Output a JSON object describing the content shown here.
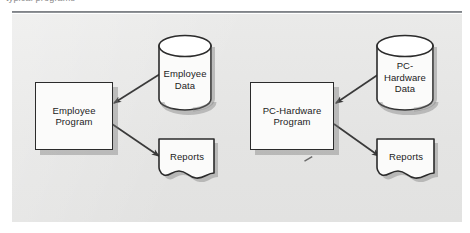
{
  "caption": {
    "text": "typical programs"
  },
  "figure": {
    "background_color": "#e7e7e6",
    "rule_color": "#6f7377",
    "shape_fill": "#fbfbfa",
    "shape_stroke": "#2b2b2b",
    "shadow_color": "#7a7a7a",
    "arrow_color": "#3a3a3a"
  },
  "systems": [
    {
      "id": "employee-system",
      "program": {
        "name": "employee-program-box",
        "label": "Employee\nProgram"
      },
      "data_store": {
        "name": "employee-data-cylinder",
        "label": "Employee\nData"
      },
      "output": {
        "name": "employee-reports-document",
        "label": "Reports"
      },
      "arrows": [
        {
          "name": "arrow-employee-data-to-program",
          "from": "employee-data-cylinder",
          "to": "employee-program-box"
        },
        {
          "name": "arrow-employee-program-to-reports",
          "from": "employee-program-box",
          "to": "employee-reports-document"
        }
      ]
    },
    {
      "id": "pc-hardware-system",
      "program": {
        "name": "pc-hardware-program-box",
        "label": "PC-Hardware\nProgram"
      },
      "data_store": {
        "name": "pc-hardware-data-cylinder",
        "label": "PC-\nHardware\nData"
      },
      "output": {
        "name": "pc-hardware-reports-document",
        "label": "Reports"
      },
      "arrows": [
        {
          "name": "arrow-pc-hardware-data-to-program",
          "from": "pc-hardware-data-cylinder",
          "to": "pc-hardware-program-box"
        },
        {
          "name": "arrow-pc-hardware-program-to-reports",
          "from": "pc-hardware-program-box",
          "to": "pc-hardware-reports-document"
        }
      ]
    }
  ]
}
